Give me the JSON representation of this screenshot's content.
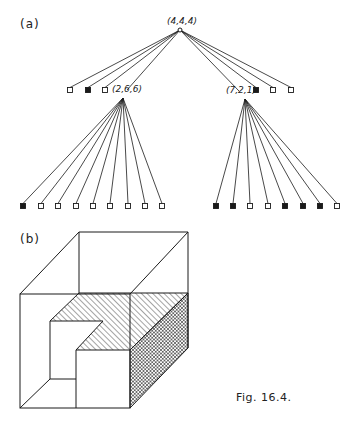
{
  "figure": {
    "caption": "Fig. 16.4.",
    "panel_a_label": "(a)",
    "panel_b_label": "(b)"
  },
  "tree": {
    "root": {
      "label": "(4,4,4)",
      "x": 180,
      "y": 30
    },
    "level1_left_leaves": [
      {
        "x": 70,
        "y": 90,
        "filled": false
      },
      {
        "x": 88,
        "y": 90,
        "filled": true
      },
      {
        "x": 105,
        "y": 90,
        "filled": false
      }
    ],
    "node_left": {
      "label": "(2,6,6)",
      "x": 123,
      "y": 98
    },
    "node_right": {
      "label": "(7,2,1)",
      "x": 245,
      "y": 99
    },
    "level1_right_leaves": [
      {
        "x": 256,
        "y": 90,
        "filled": true
      },
      {
        "x": 273,
        "y": 90,
        "filled": false
      },
      {
        "x": 291,
        "y": 90,
        "filled": false
      }
    ],
    "left_children": [
      {
        "x": 23,
        "filled": true
      },
      {
        "x": 41,
        "filled": false
      },
      {
        "x": 58,
        "filled": false
      },
      {
        "x": 76,
        "filled": false
      },
      {
        "x": 93,
        "filled": false
      },
      {
        "x": 110,
        "filled": false
      },
      {
        "x": 128,
        "filled": false
      },
      {
        "x": 145,
        "filled": false
      },
      {
        "x": 162,
        "filled": false
      }
    ],
    "right_children": [
      {
        "x": 216,
        "filled": true
      },
      {
        "x": 233,
        "filled": true
      },
      {
        "x": 250,
        "filled": false
      },
      {
        "x": 268,
        "filled": false
      },
      {
        "x": 285,
        "filled": true
      },
      {
        "x": 303,
        "filled": true
      },
      {
        "x": 320,
        "filled": true
      },
      {
        "x": 337,
        "filled": false
      }
    ],
    "children_y": 206
  },
  "colors": {
    "ink": "#1a1a1a",
    "background": "#ffffff"
  }
}
